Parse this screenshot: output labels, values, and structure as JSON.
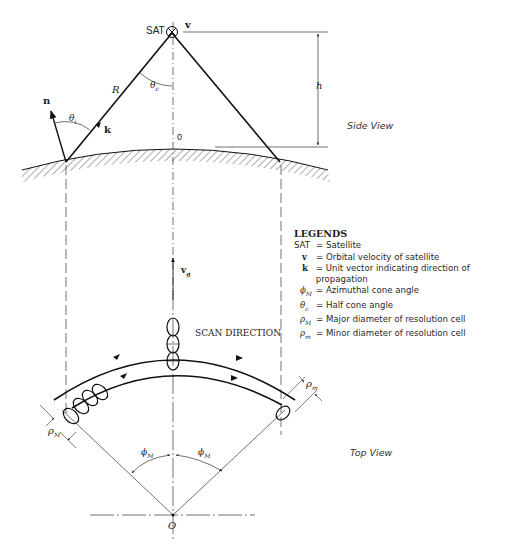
{
  "diagram": {
    "side_view": {
      "label": "Side View",
      "satellite_label": "SAT",
      "velocity_label": "v",
      "range_label": "R",
      "half_cone_angle_label": "θ",
      "half_cone_angle_sub": "c",
      "incidence_angle_label": "θ",
      "incidence_angle_sub": "i",
      "normal_vector_label": "n",
      "propagation_vector_label": "k",
      "height_label": "h",
      "nadir_label": "0"
    },
    "top_view": {
      "label": "Top View",
      "ground_velocity_label": "v",
      "ground_velocity_sub": "g",
      "scan_direction_label": "SCAN DIRECTION",
      "major_diameter_label": "ρ",
      "major_diameter_sub": "M",
      "minor_diameter_label": "ρ",
      "minor_diameter_sub": "m",
      "azimuth_left_label": "ϕ",
      "azimuth_left_sub": "M",
      "azimuth_right_label": "ϕ",
      "azimuth_right_sub": "M",
      "origin_label": "O"
    },
    "legend": {
      "title": "LEGENDS",
      "items": [
        {
          "symbol": "SAT",
          "sub": "",
          "description": "= Satellite"
        },
        {
          "symbol": "v",
          "sub": "",
          "description": "= Orbital velocity of satellite"
        },
        {
          "symbol": "k",
          "sub": "",
          "description": "= Unit vector indicating direction of propagation"
        },
        {
          "symbol": "ϕ",
          "sub": "M",
          "description": "= Azimuthal cone angle"
        },
        {
          "symbol": "θ",
          "sub": "c",
          "description": "= Half cone angle"
        },
        {
          "symbol": "ρ",
          "sub": "M",
          "description": "= Major diameter of resolution cell"
        },
        {
          "symbol": "ρ",
          "sub": "m",
          "description": "= Minor diameter of resolution cell"
        }
      ]
    }
  }
}
